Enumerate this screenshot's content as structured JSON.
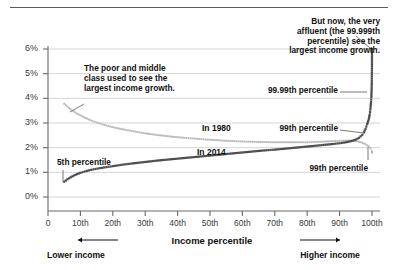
{
  "figure": {
    "background": "#ffffff",
    "rule_color": "#555e66"
  },
  "axes": {
    "y_ticks": [
      "0%",
      "1%",
      "2%",
      "3%",
      "4%",
      "5%",
      "6%"
    ],
    "x_ticks": [
      "0",
      "10th",
      "20th",
      "30th",
      "40th",
      "50th",
      "60th",
      "70th",
      "80th",
      "90th",
      "100th"
    ],
    "x_title": "Income percentile",
    "lower_income_label": "Lower income",
    "higher_income_label": "Higher income"
  },
  "annotations": {
    "poor_middle": "The poor and middle\nclass used to see the\nlargest income growth.",
    "very_affluent": "But now, the very\naffluent (the 99.999th\npercentile) see the\nlargest income growth.",
    "fifth_percentile": "5th percentile",
    "p9999": "99.99th percentile",
    "p99_upper": "99th percentile",
    "p99_lower": "99th percentile",
    "series_1980": "In 1980",
    "series_2014": "In 2014"
  },
  "colors": {
    "series_1980": "#b9b9b9",
    "series_2014": "#4c4c4c",
    "grid": "#c9c9c9",
    "axis": "#6b6b6b",
    "leader": "#6b6b6b"
  },
  "chart_data": {
    "type": "line",
    "title": "",
    "subtitle": "",
    "xlabel": "Income percentile",
    "ylabel": "",
    "xlim": [
      0,
      100
    ],
    "ylim": [
      0,
      6
    ],
    "grid": true,
    "legend": "inline-labels",
    "y_tick_values": [
      0,
      1,
      2,
      3,
      4,
      5,
      6
    ],
    "x_tick_values": [
      0,
      10,
      20,
      30,
      40,
      50,
      60,
      70,
      80,
      90,
      100
    ],
    "series": [
      {
        "name": "In 1980",
        "color": "#b9b9b9",
        "x": [
          5,
          7,
          9,
          11,
          13,
          15,
          18,
          21,
          24,
          27,
          30,
          34,
          38,
          42,
          46,
          50,
          55,
          60,
          65,
          70,
          75,
          80,
          84,
          87,
          90,
          92,
          94,
          95,
          96,
          97,
          98,
          99,
          99.5,
          99.9,
          99.99,
          99.999
        ],
        "values": [
          3.78,
          3.55,
          3.38,
          3.24,
          3.12,
          3.02,
          2.9,
          2.8,
          2.72,
          2.65,
          2.58,
          2.51,
          2.45,
          2.4,
          2.36,
          2.32,
          2.28,
          2.25,
          2.23,
          2.22,
          2.22,
          2.22,
          2.24,
          2.26,
          2.28,
          2.29,
          2.28,
          2.27,
          2.24,
          2.2,
          2.14,
          2.05,
          1.98,
          1.88,
          1.82,
          1.8
        ]
      },
      {
        "name": "In 2014",
        "color": "#4c4c4c",
        "x": [
          5,
          6,
          7,
          8,
          9,
          10,
          12,
          14,
          16,
          18,
          20,
          23,
          26,
          30,
          34,
          38,
          42,
          46,
          50,
          54,
          58,
          62,
          66,
          70,
          74,
          78,
          82,
          85,
          88,
          90,
          92,
          93,
          94,
          95,
          96,
          97,
          97.5,
          98,
          98.5,
          99,
          99.3,
          99.5,
          99.7,
          99.8,
          99.9,
          99.95,
          99.99,
          99.999
        ],
        "values": [
          0.62,
          0.72,
          0.8,
          0.87,
          0.93,
          0.98,
          1.06,
          1.12,
          1.17,
          1.21,
          1.25,
          1.31,
          1.36,
          1.42,
          1.48,
          1.53,
          1.58,
          1.63,
          1.68,
          1.73,
          1.78,
          1.83,
          1.88,
          1.92,
          1.97,
          2.02,
          2.07,
          2.11,
          2.15,
          2.18,
          2.22,
          2.25,
          2.28,
          2.33,
          2.4,
          2.52,
          2.62,
          2.76,
          2.95,
          3.15,
          3.35,
          3.55,
          3.85,
          4.05,
          4.45,
          4.8,
          5.3,
          6.0
        ]
      }
    ],
    "callouts": [
      {
        "label": "5th percentile",
        "x": 5,
        "y": 0.62,
        "series": "In 2014"
      },
      {
        "label": "99th percentile",
        "x": 99,
        "y": 3.15,
        "series": "In 2014"
      },
      {
        "label": "99.99th percentile",
        "x": 99.99,
        "y": 5.3,
        "series": "In 2014"
      },
      {
        "label": "99th percentile",
        "x": 99,
        "y": 2.05,
        "series": "In 1980"
      }
    ]
  }
}
